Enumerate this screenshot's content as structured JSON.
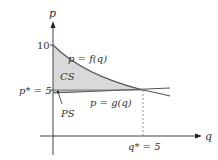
{
  "diagram": {
    "title": "",
    "axes": {
      "vertical_label": "p",
      "horizontal_label": "q"
    },
    "ticks": {
      "p_ten": "10",
      "p_star": "p* = 5",
      "q_star": "q* = 5"
    },
    "curves": {
      "demand_label": "p = f(q)",
      "supply_label": "p = g(q)"
    },
    "regions": {
      "consumer_surplus": "CS",
      "producer_surplus": "PS"
    },
    "colors": {
      "shade": "#d9d9d9",
      "curve": "#555555",
      "axis": "#444444"
    }
  }
}
